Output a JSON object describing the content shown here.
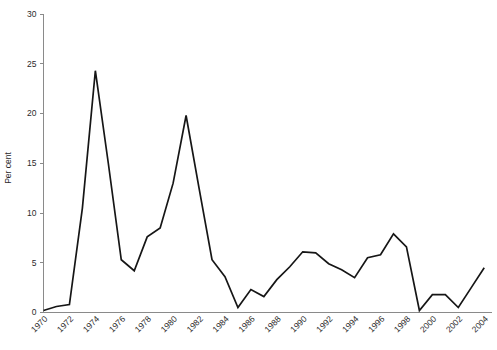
{
  "chart_data": {
    "type": "line",
    "title": "",
    "subtitle": "",
    "xlabel": "",
    "ylabel": "Per cent",
    "xlim": [
      1970,
      2004.6
    ],
    "ylim": [
      0,
      30
    ],
    "yticks": [
      0,
      5,
      10,
      15,
      20,
      25,
      30
    ],
    "ytick_labels": [
      "0",
      "5",
      "10",
      "15",
      "20",
      "25",
      "30"
    ],
    "xticks": [
      1970,
      1972,
      1974,
      1976,
      1978,
      1980,
      1982,
      1984,
      1986,
      1988,
      1990,
      1992,
      1994,
      1996,
      1998,
      2000,
      2002,
      2004
    ],
    "xtick_labels": [
      "1970",
      "1972",
      "1974",
      "1976",
      "1978",
      "1980",
      "1982",
      "1984",
      "1986",
      "1988",
      "1990",
      "1992",
      "1994",
      "1996",
      "1998",
      "2000",
      "2002",
      "2004"
    ],
    "xtick_rotation": 45,
    "grid": false,
    "legend": false,
    "legend_position": "none",
    "series": [
      {
        "name": "Per cent",
        "color": "#161616",
        "x": [
          1970,
          1971,
          1972,
          1973,
          1974,
          1975,
          1976,
          1977,
          1978,
          1979,
          1980,
          1981,
          1982,
          1983,
          1984,
          1985,
          1986,
          1987,
          1988,
          1989,
          1990,
          1991,
          1992,
          1993,
          1994,
          1995,
          1996,
          1997,
          1998,
          1999,
          2000,
          2001,
          2002,
          2003,
          2004
        ],
        "values": [
          0.2,
          0.6,
          0.8,
          10.5,
          24.3,
          15.0,
          5.3,
          4.2,
          7.6,
          8.5,
          13.0,
          19.8,
          12.5,
          5.3,
          3.6,
          0.5,
          2.3,
          1.6,
          3.3,
          4.6,
          6.1,
          6.0,
          4.9,
          4.3,
          3.5,
          5.5,
          5.8,
          7.9,
          6.6,
          0.2,
          1.8,
          1.8,
          0.5,
          2.5,
          4.5
        ]
      }
    ]
  },
  "axes": {
    "y_axis_title": "Per cent"
  }
}
